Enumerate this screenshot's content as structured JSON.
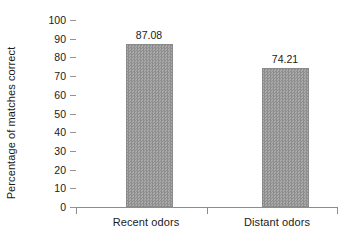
{
  "chart_data": {
    "type": "bar",
    "title": "",
    "xlabel": "",
    "ylabel": "Percentage of matches correct",
    "categories": [
      "Recent odors",
      "Distant odors"
    ],
    "values": [
      87.08,
      74.21
    ],
    "value_labels": [
      "87.08",
      "74.21"
    ],
    "ylim": [
      0,
      100
    ],
    "yticks": [
      0,
      10,
      20,
      30,
      40,
      50,
      60,
      70,
      80,
      90,
      100
    ],
    "ytick_labels": [
      "0",
      "10",
      "20",
      "30",
      "40",
      "50",
      "60",
      "70",
      "80",
      "90",
      "100"
    ],
    "grid": false,
    "legend": null,
    "bar_color": "#9a9a9a",
    "axis_color": "#8d8d8d",
    "text_color": "#1a1a1a",
    "background": "#ffffff"
  }
}
